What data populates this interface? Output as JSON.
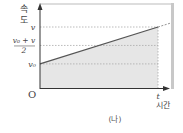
{
  "figure": {
    "caption": "(나)",
    "y_axis_label_line1": "속",
    "y_axis_label_line2": "도",
    "x_axis_label": "시간",
    "origin_label": "O",
    "x_tick_label": "t",
    "y_tick_v": "v",
    "y_tick_avg_numerator": "v₀ + v",
    "y_tick_avg_denominator": "2",
    "y_tick_v0": "v₀",
    "colors": {
      "line": "#555555",
      "axis": "#333333",
      "fill": "#e6e6e6",
      "dotted": "#aaaaaa",
      "frame": "#cccccc"
    }
  },
  "chart_data": {
    "type": "line",
    "title": "",
    "xlabel": "시간",
    "ylabel": "속도",
    "series": [
      {
        "name": "velocity",
        "x": [
          0,
          1
        ],
        "y": [
          0.4,
          1.0
        ]
      }
    ],
    "reference_lines": [
      {
        "label": "v",
        "y": 1.0
      },
      {
        "label": "(v₀+v)/2",
        "y": 0.7
      },
      {
        "label": "v₀",
        "y": 0.4
      }
    ],
    "shaded_region": "area under velocity line from 0 to t",
    "x_ticks": [
      "O",
      "t"
    ],
    "grid": false
  }
}
